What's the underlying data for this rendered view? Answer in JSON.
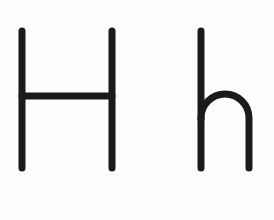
{
  "canvas": {
    "width": 274,
    "height": 220,
    "background_color": "#fdfdfd",
    "ink_color": "#1a1a1a",
    "stroke_width": 7
  },
  "content": {
    "type": "handwriting-letterform-worksheet",
    "description": "Two letterforms drawn as plain black strokes on a white background",
    "letters": [
      {
        "name": "uppercase-h",
        "character": "H",
        "case": "uppercase",
        "strokes": [
          {
            "name": "left-stem",
            "kind": "line",
            "x1": 22,
            "y1": 31,
            "x2": 22,
            "y2": 168
          },
          {
            "name": "right-stem",
            "kind": "line",
            "x1": 112,
            "y1": 31,
            "x2": 112,
            "y2": 168
          },
          {
            "name": "crossbar",
            "kind": "line",
            "x1": 22,
            "y1": 96,
            "x2": 112,
            "y2": 96
          }
        ],
        "bbox": {
          "x": 18,
          "y": 27,
          "width": 98,
          "height": 145
        }
      },
      {
        "name": "lowercase-h",
        "character": "h",
        "case": "lowercase",
        "strokes": [
          {
            "name": "ascender-stem",
            "kind": "line",
            "x1": 201,
            "y1": 31,
            "x2": 201,
            "y2": 168
          },
          {
            "name": "arch-and-leg",
            "kind": "path",
            "d": "M 201 119 L 201 118 A 24 24 0 0 1 249 118 L 249 168"
          }
        ],
        "bbox": {
          "x": 197,
          "y": 27,
          "width": 56,
          "height": 145
        }
      }
    ]
  },
  "metrics": {
    "baseline_y": 168,
    "ascender_y": 31,
    "x_height_top_y": 95,
    "crossbar_y": 96
  }
}
